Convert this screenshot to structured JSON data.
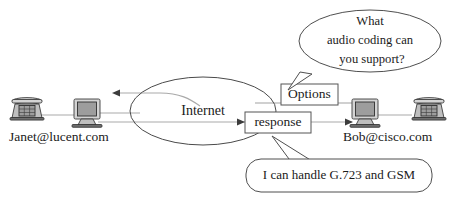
{
  "diagram": {
    "cloud": {
      "label": "Internet"
    },
    "endpoints": [
      {
        "id": "left",
        "label": "Janet@lucent.com",
        "devices": [
          "telephone-icon",
          "computer-icon"
        ]
      },
      {
        "id": "right",
        "label": "Bob@cisco.com",
        "devices": [
          "computer-icon",
          "telephone-icon"
        ]
      }
    ],
    "messages": [
      {
        "id": "options",
        "label": "Options"
      },
      {
        "id": "response",
        "label": "response"
      }
    ],
    "bubbles": [
      {
        "id": "question",
        "shape": "ellipse",
        "lines": [
          "What",
          "audio coding can",
          "you support?"
        ],
        "points_to": "options"
      },
      {
        "id": "answer",
        "shape": "rounded-rect",
        "lines": [
          "I can handle G.723 and GSM"
        ],
        "points_to": "response"
      }
    ],
    "arrows": [
      {
        "id": "arrow-to-left",
        "direction": "left"
      },
      {
        "id": "arrow-into-response",
        "direction": "right"
      },
      {
        "id": "arrow-out-response",
        "direction": "right"
      }
    ],
    "colors": {
      "line": "#a9a9a9",
      "outline": "#4a4a4a",
      "text": "#1a1a1a",
      "icon_fill": "#d4d4d4",
      "screen_fill": "#9d9d9d",
      "background": "#ffffff"
    }
  }
}
